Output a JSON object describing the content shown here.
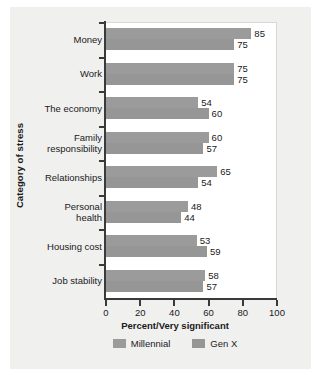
{
  "chart_data": {
    "type": "bar",
    "orientation": "horizontal",
    "title": "",
    "xlabel": "Percent/Very significant",
    "ylabel": "Category of stress",
    "xlim": [
      0,
      100
    ],
    "xticks": [
      0,
      20,
      40,
      60,
      80,
      100
    ],
    "grid": false,
    "legend_position": "bottom",
    "categories": [
      "Money",
      "Work",
      "The economy",
      "Family responsibility",
      "Relationships",
      "Personal health",
      "Housing cost",
      "Job stability"
    ],
    "category_label_lines": [
      [
        "Money"
      ],
      [
        "Work"
      ],
      [
        "The economy"
      ],
      [
        "Family",
        "responsibility"
      ],
      [
        "Relationships"
      ],
      [
        "Personal",
        "health"
      ],
      [
        "Housing cost"
      ],
      [
        "Job stability"
      ]
    ],
    "series": [
      {
        "name": "Millennial",
        "color": "#9b9b9b",
        "values": [
          85,
          75,
          54,
          60,
          65,
          48,
          53,
          58
        ]
      },
      {
        "name": "Gen X",
        "color": "#969696",
        "values": [
          75,
          75,
          60,
          57,
          54,
          44,
          59,
          57
        ]
      }
    ]
  },
  "legend": {
    "items": [
      {
        "label": "Millennial",
        "color": "#9b9b9b"
      },
      {
        "label": "Gen X",
        "color": "#969696"
      }
    ]
  },
  "colors": {
    "panel_background": "#f0f0ef",
    "plot_background": "#ffffff",
    "axis": "#3a3a3a",
    "text": "#1a1a1a"
  }
}
